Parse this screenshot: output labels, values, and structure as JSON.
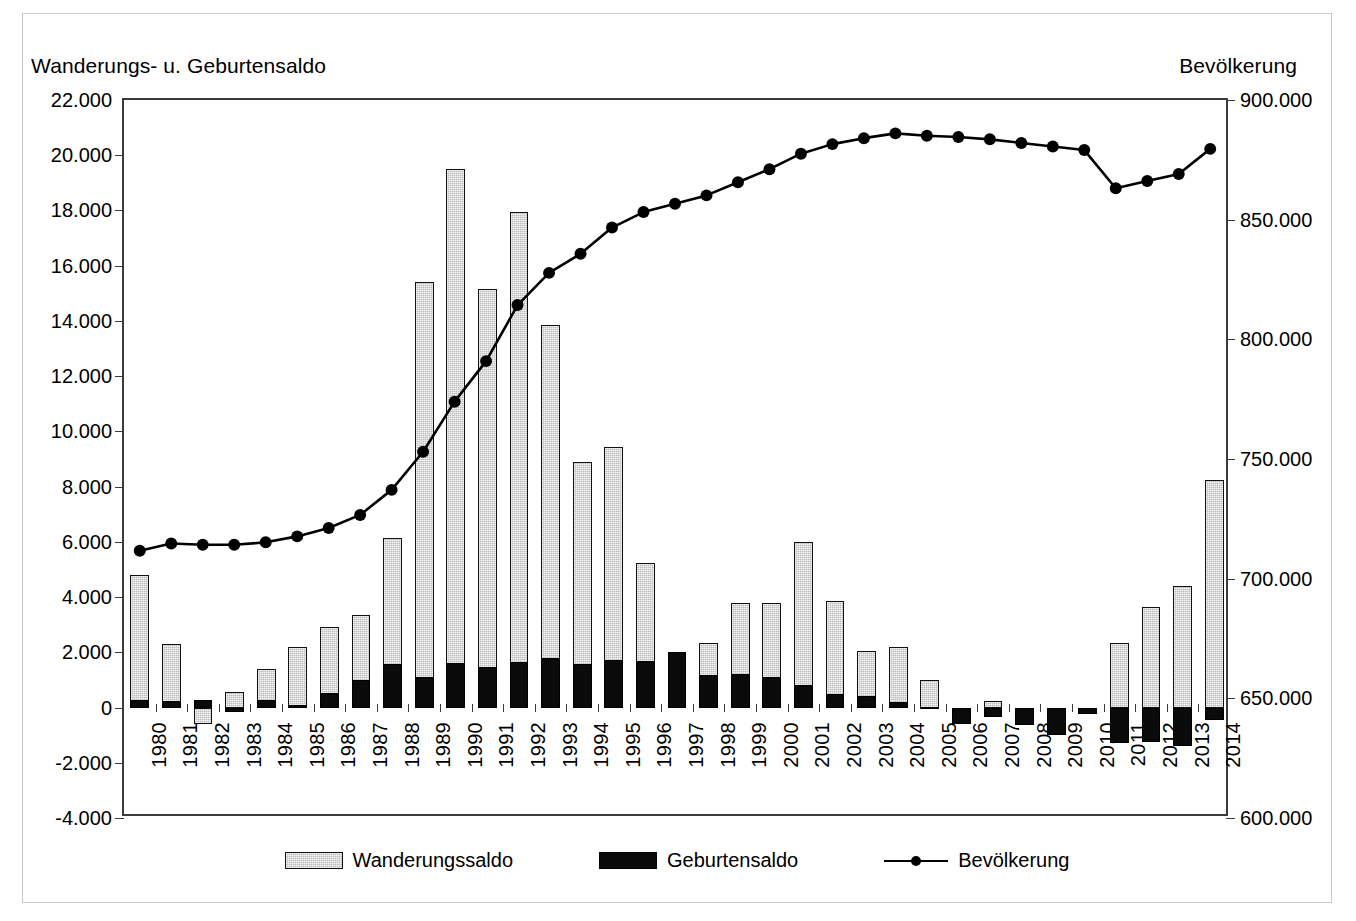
{
  "axis_titles": {
    "left": "Wanderungs- u. Geburtensaldo",
    "right": "Bevölkerung"
  },
  "legend": [
    {
      "label": "Wanderungssaldo",
      "marker": "gray-bar-swatch",
      "color": "#bdbdbd"
    },
    {
      "label": "Geburtensaldo",
      "marker": "black-bar-swatch",
      "color": "#0a0a0a"
    },
    {
      "label": "Bevölkerung",
      "marker": "line-with-dot-swatch",
      "color": "#000000"
    }
  ],
  "chart_data": {
    "type": "bar",
    "title": "",
    "subtitle": "",
    "xlabel": "",
    "ylabel": "Wanderungs- u. Geburtensaldo",
    "y2label": "Bevölkerung",
    "ylim": [
      -4000,
      22000
    ],
    "y2lim": [
      600000,
      900000
    ],
    "ytick_step": 2000,
    "y2tick_step": 50000,
    "grid": false,
    "legend_position": "bottom",
    "ytick_labels": [
      "22.000",
      "20.000",
      "18.000",
      "16.000",
      "14.000",
      "12.000",
      "10.000",
      "8.000",
      "6.000",
      "4.000",
      "2.000",
      "0",
      "-2.000",
      "-4.000"
    ],
    "ytick_values": [
      22000,
      20000,
      18000,
      16000,
      14000,
      12000,
      10000,
      8000,
      6000,
      4000,
      2000,
      0,
      -2000,
      -4000
    ],
    "y2tick_labels": [
      "900.000",
      "850.000",
      "800.000",
      "750.000",
      "700.000",
      "650.000",
      "600.000"
    ],
    "y2tick_values": [
      900000,
      850000,
      800000,
      750000,
      700000,
      650000,
      600000
    ],
    "categories": [
      "1980",
      "1981",
      "1982",
      "1983",
      "1984",
      "1985",
      "1986",
      "1987",
      "1988",
      "1989",
      "1990",
      "1991",
      "1992",
      "1993",
      "1994",
      "1995",
      "1996",
      "1997",
      "1998",
      "1999",
      "2000",
      "2001",
      "2002",
      "2003",
      "2004",
      "2005",
      "2006",
      "2007",
      "2008",
      "2009",
      "2010",
      "2011",
      "2012",
      "2013",
      "2014"
    ],
    "series": [
      {
        "name": "Wanderungssaldo",
        "axis": "left",
        "type": "bar",
        "color": "#bdbdbd",
        "values": [
          4800,
          2300,
          -600,
          550,
          1400,
          2200,
          2900,
          3350,
          6150,
          15400,
          19500,
          15150,
          17950,
          13850,
          8900,
          9450,
          5250,
          1700,
          2350,
          3800,
          3780,
          6000,
          3850,
          2050,
          2200,
          1000,
          -480,
          230,
          -350,
          -550,
          -150,
          2320,
          3650,
          4400,
          8250
        ]
      },
      {
        "name": "Geburtensaldo",
        "axis": "left",
        "type": "bar",
        "color": "#0a0a0a",
        "values": [
          280,
          250,
          290,
          -150,
          280,
          100,
          520,
          1000,
          1580,
          1100,
          1600,
          1470,
          1650,
          1800,
          1580,
          1730,
          1700,
          2000,
          1180,
          1230,
          1120,
          800,
          490,
          430,
          210,
          20,
          -600,
          -340,
          -650,
          -1000,
          -250,
          -1300,
          -1250,
          -1400,
          -450
        ]
      },
      {
        "name": "Bevölkerung",
        "axis": "right",
        "type": "line",
        "color": "#000000",
        "marker": "filled-circle",
        "values": [
          711000,
          714000,
          713500,
          713500,
          714500,
          717000,
          720500,
          726000,
          736500,
          752500,
          773500,
          790500,
          814000,
          827500,
          835500,
          846500,
          853000,
          856500,
          860000,
          865500,
          871000,
          877500,
          881500,
          884000,
          886000,
          885000,
          884500,
          883500,
          882000,
          880500,
          879000,
          863000,
          866000,
          869000,
          879500
        ]
      }
    ]
  }
}
